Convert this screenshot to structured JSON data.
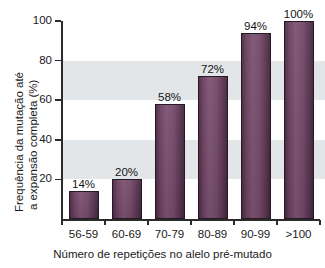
{
  "chart_data": {
    "type": "bar",
    "title": "",
    "subtitle": "",
    "categories": [
      "56-59",
      "60-69",
      "70-79",
      "80-89",
      "90-99",
      ">100"
    ],
    "values": [
      14,
      20,
      58,
      72,
      94,
      100
    ],
    "data_labels": [
      "14%",
      "20%",
      "58%",
      "72%",
      "94%",
      "100%"
    ],
    "xlabel": "Número de repetições no alelo pré-mutado",
    "ylabel_line1": "Frequência da mutação até",
    "ylabel_line2": "a expansão completa (%)",
    "ylim": [
      0,
      100
    ],
    "yticks": [
      20,
      40,
      60,
      80,
      100
    ],
    "ytick_labels": [
      "20",
      "40",
      "60",
      "80",
      "100"
    ],
    "grid": false,
    "legend": null,
    "bands": [
      {
        "name": "upper-reference-band",
        "from": 60,
        "to": 80,
        "color": "#e2e6e8"
      },
      {
        "name": "lower-reference-band",
        "from": 20,
        "to": 40,
        "color": "#e2e6e8"
      }
    ],
    "colors": {
      "bar_fill_light": "#7d5272",
      "bar_fill_dark": "#44253d",
      "bar_outline": "#231a23",
      "band": "#e2e6e8",
      "axis": "#2b2b2b",
      "text": "#1a1a1a",
      "background": "#ffffff"
    }
  }
}
